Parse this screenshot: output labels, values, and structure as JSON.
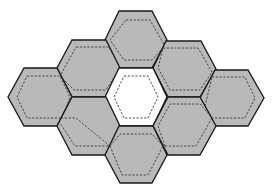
{
  "diagram": {
    "title": "",
    "colors": {
      "background": "#ffffff",
      "tile_fill": "#b9b9b9",
      "center_fill": "#ffffff",
      "outline": "#1a1a1a",
      "dashed": "#3a3a3a"
    },
    "tiles": [
      {
        "id": "top",
        "fill": "#b9b9b9",
        "points": "119,11 152,11 167,40 152,68 119,68 105,40",
        "dashed": "126,20 150,20 165,46 152,60 124,60 110,40"
      },
      {
        "id": "upper-left",
        "fill": "#b9b9b9",
        "points": "72,40 106,40 120,68 106,97 72,97 57,68",
        "dashed": "76,47 109,47 120,68 106,90 74,90 60,76"
      },
      {
        "id": "upper-right",
        "fill": "#b9b9b9",
        "points": "166,41 201,41 216,69 200,97 168,97 153,68",
        "dashed": "163,48 198,48 212,72 200,90 170,90 158,68"
      },
      {
        "id": "left",
        "fill": "#b9b9b9",
        "points": "24,68 57,68 72,97 57,126 24,126 8,97",
        "dashed": "27,76 60,76 70,97 62,118 27,118 17,97"
      },
      {
        "id": "center",
        "fill": "#ffffff",
        "points": "119,68 153,68 167,97 153,126 119,126 105,97",
        "dashed": "124,76 148,76 158,97 148,118 124,118 114,97"
      },
      {
        "id": "right",
        "fill": "#b9b9b9",
        "points": "215,70 248,70 264,98 248,126 215,126 200,98",
        "dashed": "212,77 245,77 255,98 245,118 212,118 205,106"
      },
      {
        "id": "lower-left",
        "fill": "#b9b9b9",
        "points": "72,97 106,97 120,126 106,155 72,155 57,126",
        "dashed": "61,118 76,118 110,146 75,146 62,126 57,120"
      },
      {
        "id": "lower-right",
        "fill": "#b9b9b9",
        "points": "168,97 200,97 216,126 200,155 168,155 153,126",
        "dashed": "165,146 196,146 212,118 200,104 170,104 158,126"
      },
      {
        "id": "bottom",
        "fill": "#b9b9b9",
        "points": "119,126 153,126 167,155 152,183 120,183 105,155",
        "dashed": "110,146 122,175 148,175 163,146 152,134 120,134"
      }
    ]
  }
}
